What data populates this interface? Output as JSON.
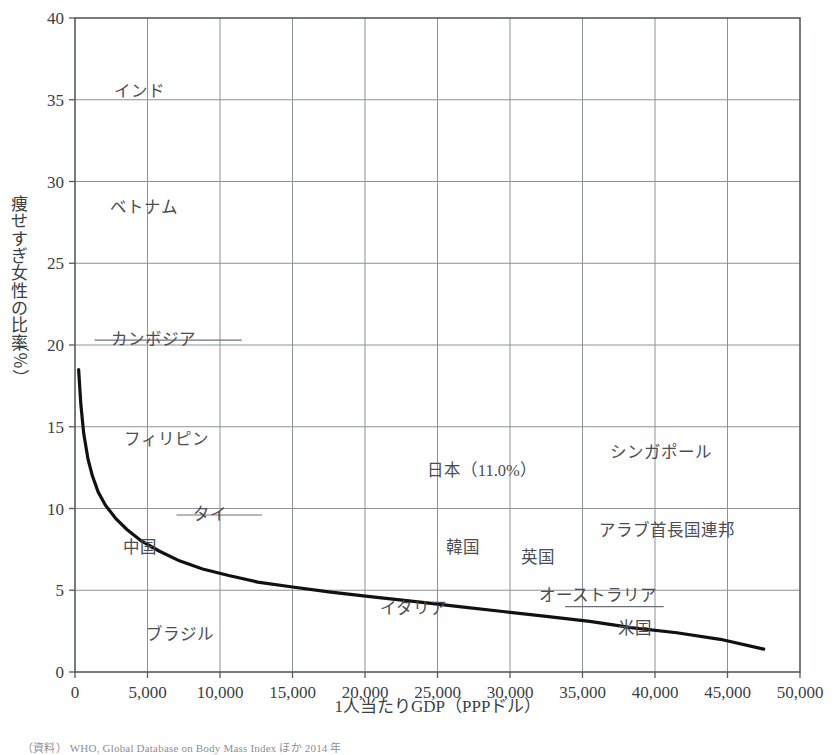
{
  "chart_data": {
    "type": "scatter",
    "title": "",
    "xlabel": "1人当たりGDP（PPPドル）",
    "ylabel": "痩せすぎ女性の比率（％）",
    "xlim": [
      0,
      50000
    ],
    "ylim": [
      0,
      40
    ],
    "xticks": [
      0,
      5000,
      10000,
      15000,
      20000,
      25000,
      30000,
      35000,
      40000,
      45000,
      50000
    ],
    "xtick_labels": [
      "0",
      "5,000",
      "10,000",
      "15,000",
      "20,000",
      "25,000",
      "30,000",
      "35,000",
      "40,000",
      "45,000",
      "50,000"
    ],
    "yticks": [
      0,
      5,
      10,
      15,
      20,
      25,
      30,
      35,
      40
    ],
    "ytick_labels": [
      "0",
      "5",
      "10",
      "15",
      "20",
      "25",
      "30",
      "35",
      "40"
    ],
    "grid": true,
    "legend": "none",
    "marker_shape": "diamond",
    "marker_color": "#111111",
    "trendline": {
      "present": true,
      "color": "#111111",
      "description": "decreasing power-law fit from about 18.5% at very low GDP to about 1.4% at 47,500 PPP dollars",
      "points": [
        [
          250,
          18.5
        ],
        [
          400,
          16.4
        ],
        [
          600,
          14.6
        ],
        [
          900,
          13.0
        ],
        [
          1200,
          12.0
        ],
        [
          1600,
          11.0
        ],
        [
          2100,
          10.2
        ],
        [
          2800,
          9.4
        ],
        [
          3600,
          8.7
        ],
        [
          4600,
          8.0
        ],
        [
          5800,
          7.4
        ],
        [
          7200,
          6.8
        ],
        [
          8800,
          6.3
        ],
        [
          10600,
          5.9
        ],
        [
          12600,
          5.5
        ],
        [
          15000,
          5.2
        ],
        [
          17500,
          4.9
        ],
        [
          20500,
          4.6
        ],
        [
          23500,
          4.3
        ],
        [
          26500,
          4.0
        ],
        [
          29500,
          3.7
        ],
        [
          32500,
          3.4
        ],
        [
          35500,
          3.1
        ],
        [
          38500,
          2.7
        ],
        [
          41500,
          2.4
        ],
        [
          44500,
          2.0
        ],
        [
          47500,
          1.4
        ]
      ]
    },
    "labeled_points": [
      {
        "label": "インド",
        "x": 1700,
        "y": 35.5,
        "label_dx": 14,
        "label_dy": 5,
        "leader": false
      },
      {
        "label": "ベトナム",
        "x": 1450,
        "y": 28.4,
        "label_dx": 14,
        "label_dy": 5,
        "leader": false
      },
      {
        "label": "カンボジア",
        "x": 1350,
        "y": 20.3,
        "label_dx": 16,
        "label_dy": 5,
        "leader": true,
        "leader_to_x": 11500
      },
      {
        "label": "フィリピン",
        "x": 2300,
        "y": 14.2,
        "label_dx": 16,
        "label_dy": 5,
        "leader": false
      },
      {
        "label": "タイ",
        "x": 7000,
        "y": 9.6,
        "label_dx": 16,
        "label_dy": 5,
        "leader": true,
        "leader_to_x": 12900
      },
      {
        "label": "中国",
        "x": 1800,
        "y": 8.4,
        "label_dx": 22,
        "label_dy": 18,
        "leader": false
      },
      {
        "label": "ブラジル",
        "x": 9000,
        "y": 3.2,
        "label_dx": -60,
        "label_dy": 20,
        "leader": false
      },
      {
        "label": "日本（11.0%）",
        "x": 29500,
        "y": 11.0,
        "label_dx": -76,
        "label_dy": -16,
        "leader": false
      },
      {
        "label": "シンガポール",
        "x": 40500,
        "y": 12.1,
        "label_dx": -52,
        "label_dy": -16,
        "leader": false
      },
      {
        "label": "アラブ首長国連邦",
        "x": 44800,
        "y": 9.9,
        "label_dx": -126,
        "label_dy": 26,
        "leader": false
      },
      {
        "label": "韓国",
        "x": 25000,
        "y": 6.4,
        "label_dx": 8,
        "label_dy": -14,
        "leader": false
      },
      {
        "label": "英国",
        "x": 30500,
        "y": 5.8,
        "label_dx": 4,
        "label_dy": -14,
        "leader": false
      },
      {
        "label": "イタリア",
        "x": 26000,
        "y": 4.4,
        "label_dx": -72,
        "label_dy": 14,
        "leader": false
      },
      {
        "label": "オーストラリア",
        "x": 33800,
        "y": 4.0,
        "label_dx": -26,
        "label_dy": -6,
        "leader": true,
        "leader_to_x": 40600
      },
      {
        "label": "米国",
        "x": 41000,
        "y": 3.3,
        "label_dx": -52,
        "label_dy": 16,
        "leader": false
      }
    ],
    "points": [
      [
        500,
        37.8
      ],
      [
        520,
        37.3
      ],
      [
        1700,
        35.5
      ],
      [
        1350,
        31.5
      ],
      [
        700,
        29.8
      ],
      [
        1450,
        28.4
      ],
      [
        450,
        26.4
      ],
      [
        1450,
        25.1
      ],
      [
        700,
        24.4
      ],
      [
        1050,
        20.6
      ],
      [
        1150,
        20.4
      ],
      [
        1350,
        20.3
      ],
      [
        1450,
        20.2
      ],
      [
        600,
        19.3
      ],
      [
        700,
        19.3
      ],
      [
        250,
        18.5
      ],
      [
        1500,
        18.3
      ],
      [
        5900,
        15.9
      ],
      [
        650,
        15.4
      ],
      [
        700,
        15.2
      ],
      [
        1150,
        15.2
      ],
      [
        2300,
        14.2
      ],
      [
        1000,
        13.6
      ],
      [
        1100,
        13.4
      ],
      [
        1250,
        13.3
      ],
      [
        2900,
        13.2
      ],
      [
        800,
        12.3
      ],
      [
        850,
        12.1
      ],
      [
        700,
        10.8
      ],
      [
        250,
        10.0
      ],
      [
        400,
        10.0
      ],
      [
        600,
        9.9
      ],
      [
        800,
        9.9
      ],
      [
        1050,
        9.8
      ],
      [
        2150,
        9.9
      ],
      [
        11300,
        10.0
      ],
      [
        7000,
        9.6
      ],
      [
        650,
        9.3
      ],
      [
        900,
        9.2
      ],
      [
        1150,
        9.0
      ],
      [
        350,
        8.8
      ],
      [
        500,
        8.7
      ],
      [
        900,
        8.6
      ],
      [
        1350,
        8.5
      ],
      [
        1800,
        8.4
      ],
      [
        250,
        8.3
      ],
      [
        1500,
        8.3
      ],
      [
        3600,
        7.4
      ],
      [
        5200,
        7.5
      ],
      [
        9200,
        7.3
      ],
      [
        1150,
        7.0
      ],
      [
        1350,
        6.9
      ],
      [
        1450,
        6.8
      ],
      [
        1550,
        6.8
      ],
      [
        7500,
        6.4
      ],
      [
        8500,
        6.0
      ],
      [
        8900,
        6.1
      ],
      [
        13200,
        6.5
      ],
      [
        13600,
        6.1
      ],
      [
        700,
        5.9
      ],
      [
        900,
        5.8
      ],
      [
        1200,
        5.8
      ],
      [
        1500,
        5.8
      ],
      [
        1750,
        5.8
      ],
      [
        3300,
        5.3
      ],
      [
        3500,
        5.1
      ],
      [
        3400,
        4.9
      ],
      [
        1450,
        5.0
      ],
      [
        9600,
        5.1
      ],
      [
        15000,
        5.3
      ],
      [
        21600,
        5.5
      ],
      [
        22000,
        4.6
      ],
      [
        25000,
        6.4
      ],
      [
        23500,
        6.8
      ],
      [
        28500,
        5.6
      ],
      [
        30500,
        5.8
      ],
      [
        31800,
        5.4
      ],
      [
        37800,
        5.5
      ],
      [
        26000,
        4.4
      ],
      [
        28800,
        3.9
      ],
      [
        29500,
        3.3
      ],
      [
        33800,
        4.0
      ],
      [
        33600,
        4.3
      ],
      [
        34000,
        3.5
      ],
      [
        32200,
        2.9
      ],
      [
        31600,
        3.0
      ],
      [
        34200,
        2.4
      ],
      [
        34400,
        2.2
      ],
      [
        40600,
        2.9
      ],
      [
        41000,
        3.3
      ],
      [
        41200,
        0.9
      ],
      [
        44800,
        9.9
      ],
      [
        40500,
        12.1
      ],
      [
        29500,
        11.0
      ],
      [
        47000,
        6.9
      ],
      [
        4800,
        4.6
      ],
      [
        5400,
        4.7
      ],
      [
        6200,
        4.7
      ],
      [
        8500,
        3.9
      ],
      [
        9000,
        3.2
      ],
      [
        11000,
        3.3
      ],
      [
        12000,
        3.3
      ],
      [
        13200,
        3.0
      ],
      [
        2600,
        3.6
      ],
      [
        3100,
        3.9
      ],
      [
        2200,
        2.7
      ],
      [
        2900,
        2.9
      ],
      [
        5200,
        3.9
      ],
      [
        6200,
        2.8
      ],
      [
        16000,
        2.9
      ],
      [
        1900,
        1.7
      ],
      [
        3000,
        1.4
      ],
      [
        6000,
        1.6
      ],
      [
        11700,
        0.2
      ],
      [
        11500,
        1.0
      ],
      [
        11900,
        1.1
      ],
      [
        13800,
        1.8
      ],
      [
        2600,
        0.6
      ],
      [
        8400,
        0.7
      ],
      [
        17500,
        3.7
      ],
      [
        22000,
        3.3
      ],
      [
        25000,
        1.5
      ],
      [
        3800,
        5.2
      ],
      [
        3900,
        5.3
      ],
      [
        1250,
        5.1
      ],
      [
        1150,
        5.1
      ],
      [
        1700,
        5.9
      ]
    ]
  },
  "source": {
    "prefix": "（資料）",
    "text": "WHO, Global Database on Body Mass Index ほか 2014 年"
  }
}
